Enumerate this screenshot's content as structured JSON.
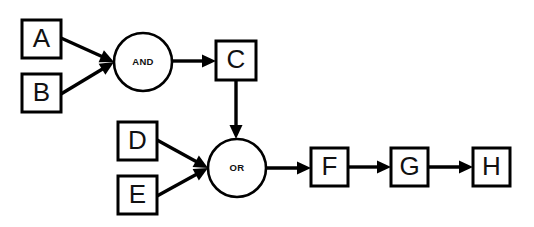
{
  "diagram": {
    "type": "logic-gate-flow-diagram",
    "background_color": "#ffffff",
    "stroke_color": "#000000",
    "nodes": [
      {
        "id": "A",
        "label": "A",
        "shape": "rect",
        "x": 22,
        "y": 20,
        "w": 39,
        "h": 38
      },
      {
        "id": "B",
        "label": "B",
        "shape": "rect",
        "x": 22,
        "y": 74,
        "w": 39,
        "h": 38
      },
      {
        "id": "AND",
        "label": "AND",
        "shape": "circle",
        "cx": 143,
        "cy": 62,
        "r": 29
      },
      {
        "id": "C",
        "label": "C",
        "shape": "rect",
        "x": 216,
        "y": 41,
        "w": 40,
        "h": 39
      },
      {
        "id": "D",
        "label": "D",
        "shape": "rect",
        "x": 118,
        "y": 122,
        "w": 39,
        "h": 38
      },
      {
        "id": "E",
        "label": "E",
        "shape": "rect",
        "x": 118,
        "y": 176,
        "w": 39,
        "h": 38
      },
      {
        "id": "OR",
        "label": "OR",
        "shape": "circle",
        "cx": 237,
        "cy": 168,
        "r": 29
      },
      {
        "id": "F",
        "label": "F",
        "shape": "rect",
        "x": 311,
        "y": 148,
        "w": 37,
        "h": 38
      },
      {
        "id": "G",
        "label": "G",
        "shape": "rect",
        "x": 391,
        "y": 148,
        "w": 37,
        "h": 38
      },
      {
        "id": "H",
        "label": "H",
        "shape": "rect",
        "x": 473,
        "y": 148,
        "w": 37,
        "h": 38
      }
    ],
    "edges": [
      {
        "id": "A-AND",
        "from": "A",
        "to": "AND",
        "x1": 61,
        "y1": 38,
        "x2": 114,
        "y2": 62,
        "arrow": true
      },
      {
        "id": "B-AND",
        "from": "B",
        "to": "AND",
        "x1": 61,
        "y1": 94,
        "x2": 114,
        "y2": 62,
        "arrow": true
      },
      {
        "id": "AND-C",
        "from": "AND",
        "to": "C",
        "x1": 172,
        "y1": 61,
        "x2": 216,
        "y2": 61,
        "arrow": true
      },
      {
        "id": "C-OR",
        "from": "C",
        "to": "OR",
        "x1": 236,
        "y1": 80,
        "x2": 236,
        "y2": 139,
        "arrow": true
      },
      {
        "id": "D-OR",
        "from": "D",
        "to": "OR",
        "x1": 157,
        "y1": 140,
        "x2": 208,
        "y2": 168,
        "arrow": true
      },
      {
        "id": "E-OR",
        "from": "E",
        "to": "OR",
        "x1": 157,
        "y1": 196,
        "x2": 208,
        "y2": 168,
        "arrow": true
      },
      {
        "id": "OR-F",
        "from": "OR",
        "to": "F",
        "x1": 266,
        "y1": 168,
        "x2": 311,
        "y2": 168,
        "arrow": true
      },
      {
        "id": "F-G",
        "from": "F",
        "to": "G",
        "x1": 348,
        "y1": 167,
        "x2": 391,
        "y2": 167,
        "arrow": true
      },
      {
        "id": "G-H",
        "from": "G",
        "to": "H",
        "x1": 428,
        "y1": 167,
        "x2": 473,
        "y2": 167,
        "arrow": true
      }
    ]
  }
}
